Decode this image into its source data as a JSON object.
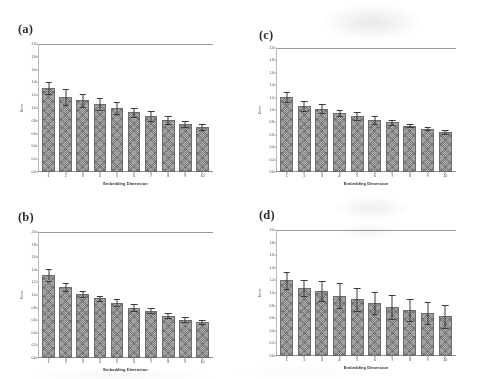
{
  "figure": {
    "background": "#ffffff",
    "bar_color": "#7b7b7b",
    "error_color": "#3b3b3b",
    "axis_color": "#8e8e8e"
  },
  "axis": {
    "ylabel": "Error",
    "xlabel": "Embedding Dimension",
    "yticks": [
      "2.0",
      "1.8",
      "1.6",
      "1.4",
      "1.2",
      "1.0",
      "0.8",
      "0.6",
      "0.4",
      "0.2",
      "0.0"
    ],
    "ylim": [
      0.0,
      2.0
    ],
    "xticks": [
      "1",
      "2",
      "3",
      "4",
      "5",
      "6",
      "7",
      "8",
      "9",
      "10"
    ]
  },
  "panels": [
    {
      "label": "(a)"
    },
    {
      "label": "(b)"
    },
    {
      "label": "(c)"
    },
    {
      "label": "(d)"
    }
  ],
  "chart_data": [
    {
      "type": "bar",
      "panel": "(a)",
      "title": "",
      "xlabel": "Embedding Dimension",
      "ylabel": "Error",
      "ylim": [
        0.0,
        2.0
      ],
      "grid": false,
      "legend": "none",
      "categories": [
        "1",
        "2",
        "3",
        "4",
        "5",
        "6",
        "7",
        "8",
        "9",
        "10"
      ],
      "values": [
        1.31,
        1.17,
        1.12,
        1.06,
        1.0,
        0.93,
        0.87,
        0.81,
        0.75,
        0.7
      ],
      "errors": [
        0.09,
        0.13,
        0.1,
        0.09,
        0.09,
        0.07,
        0.08,
        0.06,
        0.05,
        0.05
      ]
    },
    {
      "type": "bar",
      "panel": "(b)",
      "title": "",
      "xlabel": "Embedding Dimension",
      "ylabel": "Error",
      "ylim": [
        0.0,
        2.0
      ],
      "grid": false,
      "legend": "none",
      "categories": [
        "1",
        "2",
        "3",
        "4",
        "5",
        "6",
        "7",
        "8",
        "9",
        "10"
      ],
      "values": [
        1.32,
        1.13,
        1.02,
        0.95,
        0.88,
        0.8,
        0.75,
        0.67,
        0.61,
        0.57
      ],
      "errors": [
        0.09,
        0.06,
        0.05,
        0.04,
        0.06,
        0.06,
        0.04,
        0.04,
        0.04,
        0.03
      ]
    },
    {
      "type": "bar",
      "panel": "(c)",
      "title": "",
      "xlabel": "Embedding Dimension",
      "ylabel": "Error",
      "ylim": [
        0.0,
        2.0
      ],
      "grid": false,
      "legend": "none",
      "categories": [
        "1",
        "2",
        "3",
        "4",
        "5",
        "6",
        "7",
        "8",
        "9",
        "10"
      ],
      "values": [
        1.21,
        1.06,
        1.02,
        0.95,
        0.9,
        0.84,
        0.8,
        0.75,
        0.7,
        0.64
      ],
      "errors": [
        0.08,
        0.08,
        0.07,
        0.05,
        0.06,
        0.07,
        0.04,
        0.03,
        0.03,
        0.03
      ]
    },
    {
      "type": "bar",
      "panel": "(d)",
      "title": "",
      "xlabel": "Embedding Dimension",
      "ylabel": "Error",
      "ylim": [
        0.0,
        2.0
      ],
      "grid": false,
      "legend": "none",
      "categories": [
        "1",
        "2",
        "3",
        "4",
        "5",
        "6",
        "7",
        "8",
        "9",
        "10"
      ],
      "values": [
        1.2,
        1.08,
        1.03,
        0.96,
        0.9,
        0.84,
        0.78,
        0.73,
        0.68,
        0.63
      ],
      "errors": [
        0.14,
        0.12,
        0.16,
        0.2,
        0.18,
        0.17,
        0.19,
        0.18,
        0.17,
        0.18
      ]
    }
  ]
}
